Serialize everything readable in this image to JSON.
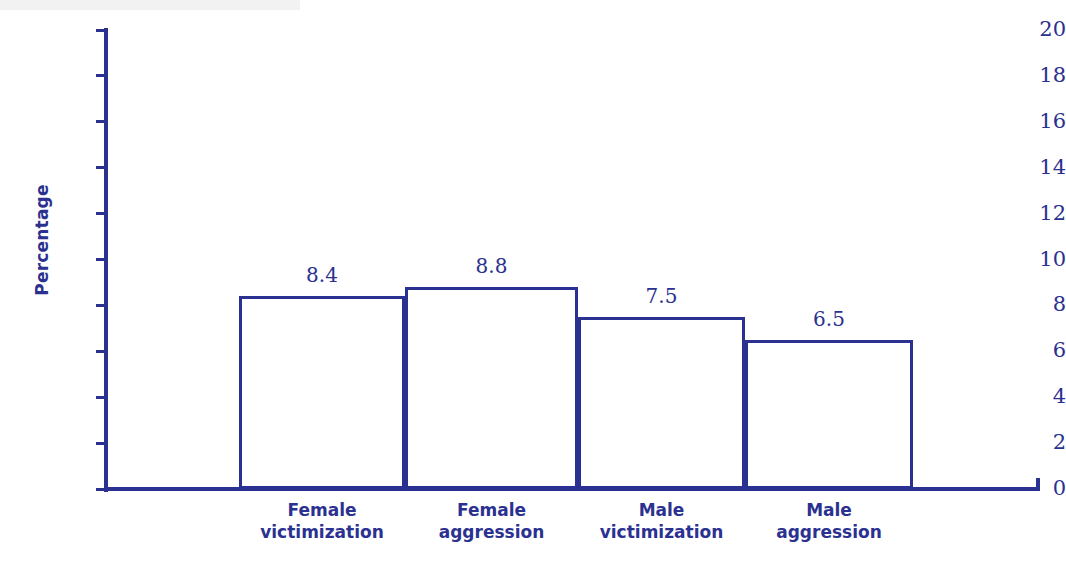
{
  "chart_data": {
    "type": "bar",
    "title": "",
    "subtitle": "",
    "xlabel": "",
    "ylabel": "Percentage",
    "ylim": [
      0,
      20
    ],
    "ytick_values": [
      20,
      18,
      16,
      14,
      12,
      10,
      8,
      6,
      4,
      2,
      0
    ],
    "ytick_labels": [
      "20",
      "18",
      "16",
      "14",
      "12",
      "10",
      "8",
      "6",
      "4",
      "2",
      "0"
    ],
    "grid": false,
    "legend": null,
    "categories": [
      "Female victimization",
      "Female aggression",
      "Male victimization",
      "Male aggression"
    ],
    "category_lines": [
      [
        "Female",
        "victimization"
      ],
      [
        "Female",
        "aggression"
      ],
      [
        "Male",
        "victimization"
      ],
      [
        "Male",
        "aggression"
      ]
    ],
    "values": [
      8.4,
      8.8,
      7.5,
      6.5
    ],
    "value_labels": [
      "8.4",
      "8.8",
      "7.5",
      "6.5"
    ],
    "bar_style": {
      "fill": "#ffffff",
      "edge": "#2b3190",
      "edge_width": 3,
      "gap": 0
    }
  },
  "colors": {
    "accent": "#2b3190",
    "background": "#ffffff"
  }
}
